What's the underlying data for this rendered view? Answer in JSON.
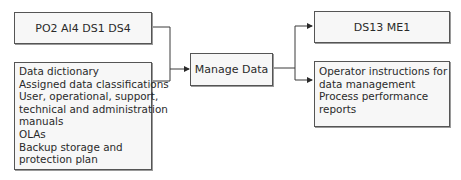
{
  "diagram": {
    "inputs": {
      "box1_label": "PO2 AI4 DS1 DS4",
      "box2_lines": [
        "Data dictionary",
        "Assigned data classifications",
        "User, operational, support,",
        "technical and administration",
        "manuals",
        "OLAs",
        "Backup storage and",
        "protection plan"
      ]
    },
    "process": {
      "label": "Manage Data"
    },
    "outputs": {
      "box1_label": "DS13 ME1",
      "box2_lines": [
        "Operator instructions for",
        "data management",
        "Process performance",
        "reports"
      ]
    },
    "colors": {
      "line": "#3a3a3a",
      "box_fill": "#f7f7f7",
      "box_border": "#555555"
    }
  }
}
